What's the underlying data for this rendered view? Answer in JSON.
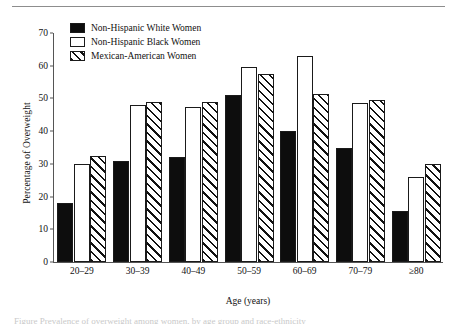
{
  "figure": {
    "top_rule": true,
    "caption_partial": "Figure  Prevalence of overweight among women, by age group and race-ethnicity"
  },
  "legend": {
    "position": "top-left-inside",
    "entries": [
      {
        "label": "Non-Hispanic White Women",
        "style": "solid",
        "color": "#0d0d0d"
      },
      {
        "label": "Non-Hispanic Black Women",
        "style": "open",
        "color": "#ffffff"
      },
      {
        "label": "Mexican-American Women",
        "style": "hatched",
        "color": "#ffffff"
      }
    ]
  },
  "chart_data": {
    "type": "bar",
    "title": "",
    "xlabel": "Age (years)",
    "ylabel": "Percentage of Overweight",
    "categories": [
      "20–29",
      "30–39",
      "40–49",
      "50–59",
      "60–69",
      "70–79",
      "≥80"
    ],
    "yticks": [
      0,
      10,
      20,
      30,
      40,
      50,
      60,
      70
    ],
    "ylim": [
      0,
      70
    ],
    "grid": false,
    "series": [
      {
        "name": "Non-Hispanic White Women",
        "style": "solid",
        "values": [
          18,
          31,
          32,
          51,
          40,
          35,
          15.5
        ]
      },
      {
        "name": "Non-Hispanic Black Women",
        "style": "open",
        "values": [
          30,
          48,
          47.5,
          59.5,
          63,
          48.5,
          26
        ]
      },
      {
        "name": "Mexican-American Women",
        "style": "hatched",
        "values": [
          32.5,
          49,
          49,
          57.5,
          51.5,
          49.5,
          30
        ]
      }
    ]
  }
}
